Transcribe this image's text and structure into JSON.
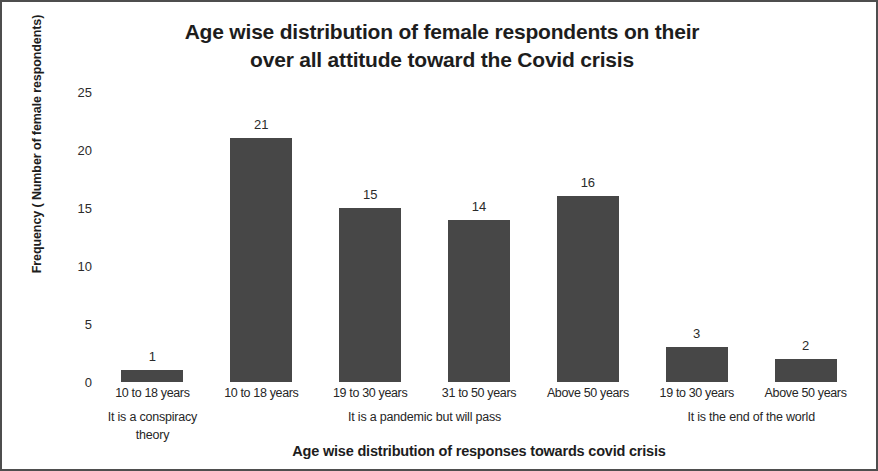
{
  "chart_data": {
    "type": "bar",
    "title": "Age wise distribution of female respondents on their over all attitude toward the Covid crisis",
    "title_line1": "Age wise distribution of female respondents on their",
    "title_line2": "over all attitude toward the Covid crisis",
    "xlabel": "Age wise distribution of responses towards covid crisis",
    "ylabel": "Frequency ( Number of female respondents)",
    "categories": [
      "10 to 18 years",
      "10 to 18 years",
      "19 to 30 years",
      "31 to 50 years",
      "Above 50 years",
      "19 to 30 years",
      "Above 50 years"
    ],
    "values": [
      1,
      21,
      15,
      14,
      16,
      3,
      2
    ],
    "group_labels": [
      "It is a conspiracy theory",
      "It is a pandemic but will pass",
      "It is the end of the world"
    ],
    "group_spans": [
      1,
      4,
      2
    ],
    "ylim": [
      0,
      25
    ],
    "yticks": [
      0,
      5,
      10,
      15,
      20,
      25
    ],
    "grid": false,
    "legend": false,
    "bar_color": "#474747",
    "text_color": "#1d1d1d",
    "background": "#ffffff",
    "border_color": "#4e4e4e"
  }
}
